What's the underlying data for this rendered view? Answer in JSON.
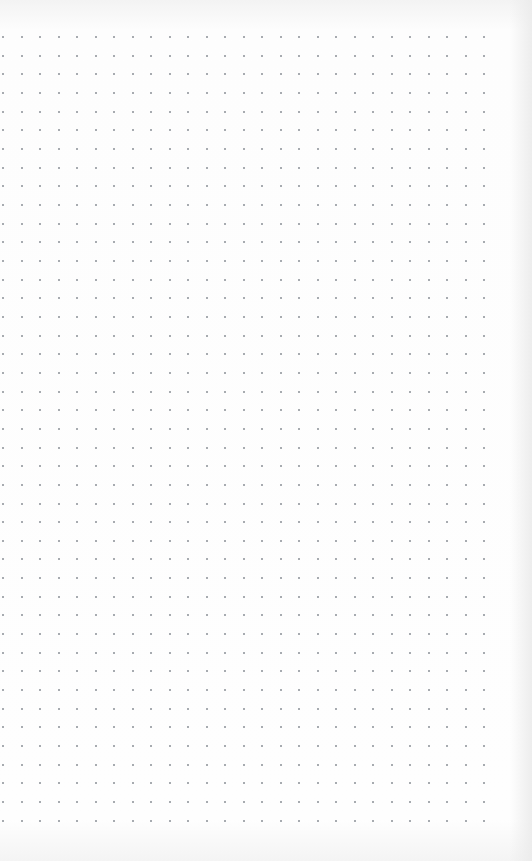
{
  "page": {
    "type": "dot-grid-paper",
    "background": "#fdfdfd",
    "dot_color": "#8a8f96",
    "grid": {
      "columns": 27,
      "rows": 43,
      "origin_x": 3,
      "origin_y": 37,
      "spacing_x": 18.5,
      "spacing_y": 18.66
    }
  }
}
